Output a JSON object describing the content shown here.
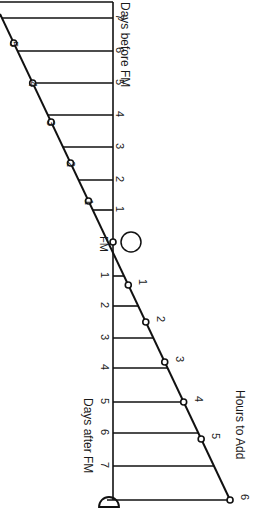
{
  "diagram": {
    "title_hours": "Hours to Add",
    "label_days_before": "Days before FM",
    "label_days_after": "Days after FM",
    "label_fm": "FM",
    "full_moon_symbol": "full-moon-circle",
    "new_moon_symbol": "crescent-moon",
    "days_before": [
      "7",
      "6",
      "5",
      "4",
      "3",
      "2",
      "1"
    ],
    "days_after": [
      "1",
      "2",
      "3",
      "4",
      "5",
      "6",
      "7"
    ],
    "hours_before": [
      "5",
      "4",
      "3",
      "2",
      "1"
    ],
    "hours_after": [
      "1",
      "2",
      "3",
      "4",
      "5",
      "6"
    ]
  },
  "chart_data": {
    "type": "line",
    "title": "Hours to Add",
    "xlabel_before": "Days before FM",
    "xlabel_after": "Days after FM",
    "center_label": "FM",
    "series": [
      {
        "name": "Hours to Add (before FM)",
        "points": [
          {
            "days": -6.3,
            "hours": 5
          },
          {
            "days": -5,
            "hours": 4
          },
          {
            "days": -3.8,
            "hours": 3
          },
          {
            "days": -2.5,
            "hours": 2
          },
          {
            "days": -1.3,
            "hours": 1
          }
        ]
      },
      {
        "name": "Hours to Add (after FM)",
        "points": [
          {
            "days": 1.3,
            "hours": 1
          },
          {
            "days": 2.5,
            "hours": 2
          },
          {
            "days": 3.8,
            "hours": 3
          },
          {
            "days": 5,
            "hours": 4
          },
          {
            "days": 6.2,
            "hours": 5
          },
          {
            "days": 8,
            "hours": 6
          }
        ]
      }
    ]
  }
}
